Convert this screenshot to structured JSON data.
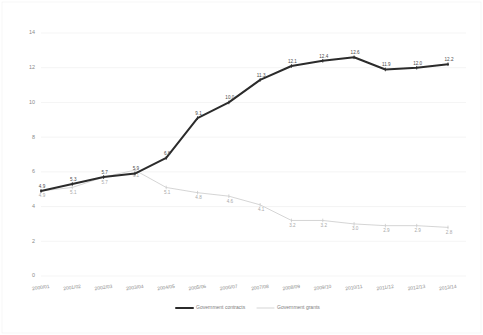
{
  "chart_data": {
    "type": "line",
    "title": "",
    "xlabel": "",
    "ylabel": "",
    "ylim": [
      0,
      14
    ],
    "yticks": [
      0,
      2,
      4,
      6,
      8,
      10,
      12,
      14
    ],
    "ytick_labels": [
      "0",
      "2",
      "4",
      "6",
      "8",
      "10",
      "12",
      "14"
    ],
    "grid": true,
    "grid_axis": "y",
    "legend_position": "bottom",
    "categories": [
      "2000/01",
      "2001/02",
      "2002/03",
      "2003/04",
      "2004/05",
      "2005/06",
      "2006/07",
      "2007/08",
      "2008/09",
      "2009/10",
      "2010/11",
      "2011/12",
      "2012/13",
      "2013/14"
    ],
    "series": [
      {
        "name": "Government contracts",
        "color": "#2b2b2b",
        "style": "thick-solid",
        "values": [
          4.9,
          5.3,
          5.7,
          5.9,
          6.8,
          9.1,
          10.0,
          11.3,
          12.1,
          12.4,
          12.6,
          11.9,
          12.0,
          12.2
        ],
        "labels": [
          "4.9",
          "5.3",
          "5.7",
          "5.9",
          "6.8",
          "9.1",
          "10.0",
          "11.3",
          "12.1",
          "12.4",
          "12.6",
          "11.9",
          "12.0",
          "12.2"
        ]
      },
      {
        "name": "Government grants",
        "color": "#d0d0d0",
        "style": "thin-solid",
        "values": [
          4.9,
          5.1,
          5.7,
          6.1,
          5.1,
          4.8,
          4.6,
          4.1,
          3.2,
          3.2,
          3.0,
          2.9,
          2.9,
          2.8
        ],
        "labels": [
          "4.9",
          "5.1",
          "5.7",
          "6.1",
          "5.1",
          "4.8",
          "4.6",
          "4.1",
          "3.2",
          "3.2",
          "3.0",
          "2.9",
          "2.9",
          "2.8"
        ]
      }
    ]
  },
  "legend": {
    "items": [
      {
        "label": "Government contracts",
        "swatch": "thick-dark-line"
      },
      {
        "label": "Government grants",
        "swatch": "thin-light-line"
      }
    ]
  }
}
